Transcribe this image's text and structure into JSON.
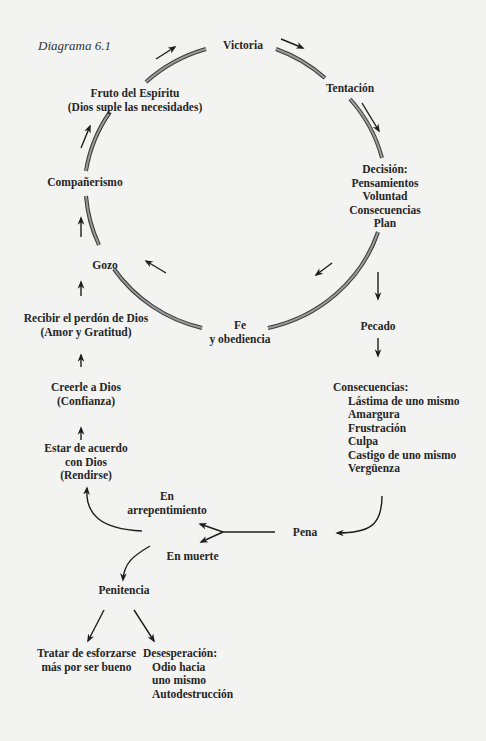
{
  "caption": "Diagrama 6.1",
  "cycle": {
    "victoria": [
      "Victoria"
    ],
    "tentacion": [
      "Tentación"
    ],
    "decision": [
      "Decisión:",
      "Pensamientos",
      "Voluntad",
      "Consecuencias",
      "Plan"
    ],
    "fe": [
      "Fe",
      "y obediencia"
    ],
    "gozo": [
      "Gozo"
    ],
    "companerismo": [
      "Compañerismo"
    ],
    "fruto": [
      "Fruto del Espíritu",
      "(Dios suple las necesidades)"
    ]
  },
  "right_chain": {
    "pecado": [
      "Pecado"
    ],
    "consecuencias_title": "Consecuencias:",
    "consecuencias_items": [
      "Lástima de uno mismo",
      "Amargura",
      "Frustración",
      "Culpa",
      "Castigo de uno mismo",
      "Vergüenza"
    ],
    "pena": [
      "Pena"
    ]
  },
  "left_chain": {
    "recibir": [
      "Recibir el perdón de Dios",
      "(Amor y Gratitud)"
    ],
    "creerle": [
      "Creerle a Dios",
      "(Confianza)"
    ],
    "estar": [
      "Estar de acuerdo",
      "con Dios",
      "(Rendirse)"
    ],
    "arrepentimiento": [
      "En",
      "arrepentimiento"
    ],
    "muerte": [
      "En muerte"
    ],
    "penitencia": [
      "Penitencia"
    ],
    "tratar": [
      "Tratar de esforzarse",
      "más por ser bueno"
    ],
    "desesperacion_title": "Desesperación:",
    "desesperacion_items": [
      "Odio hacia",
      "uno mismo",
      "Autodestrucción"
    ]
  },
  "colors": {
    "background": "#f3f3f1",
    "text": "#262626",
    "ring_fill": "#9a9a9a",
    "ring_edge": "#3a3a3a",
    "arrow": "#1e1e1e"
  }
}
